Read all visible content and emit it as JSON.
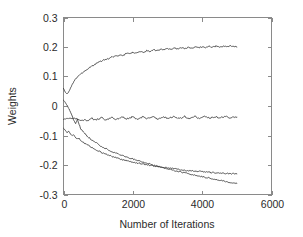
{
  "chart_data": {
    "type": "line",
    "title": "",
    "xlabel": "Number of Iterations",
    "ylabel": "Weights",
    "xlim": [
      0,
      6000
    ],
    "ylim": [
      -0.3,
      0.3
    ],
    "xticks": [
      0,
      2000,
      4000,
      6000
    ],
    "xticklabels": [
      "0",
      "2000",
      "4000",
      "6000"
    ],
    "yticks": [
      -0.3,
      -0.2,
      -0.1,
      0,
      0.1,
      0.2,
      0.3
    ],
    "yticklabels": [
      "-0.3",
      "-0.2",
      "-0.1",
      "0",
      "0.1",
      "0.2",
      "0.3"
    ],
    "grid": false,
    "legend": null,
    "line_color": "#3a3a3a",
    "axis_color": "#8a8a8a",
    "background": "#ffffff",
    "x_sample_points": [
      0,
      50,
      100,
      150,
      200,
      250,
      300,
      350,
      400,
      450,
      500,
      600,
      700,
      800,
      900,
      1000,
      1100,
      1200,
      1300,
      1400,
      1500,
      1600,
      1700,
      1800,
      1900,
      2000,
      2100,
      2200,
      2300,
      2400,
      2500,
      2600,
      2700,
      2800,
      2900,
      3000,
      3100,
      3200,
      3300,
      3400,
      3500,
      3600,
      3700,
      3800,
      3900,
      4000,
      4100,
      4200,
      4300,
      4400,
      4500,
      4600,
      4700,
      4800,
      4900,
      5000
    ],
    "series": [
      {
        "name": "weight-1",
        "start_value": 0.06,
        "final_value": 0.2,
        "values": [
          0.06,
          0.047,
          0.04,
          0.048,
          0.06,
          0.072,
          0.083,
          0.092,
          0.098,
          0.104,
          0.108,
          0.118,
          0.126,
          0.134,
          0.141,
          0.148,
          0.152,
          0.158,
          0.16,
          0.166,
          0.168,
          0.172,
          0.17,
          0.176,
          0.178,
          0.181,
          0.179,
          0.184,
          0.182,
          0.187,
          0.185,
          0.19,
          0.187,
          0.192,
          0.19,
          0.194,
          0.191,
          0.196,
          0.193,
          0.197,
          0.195,
          0.199,
          0.196,
          0.2,
          0.197,
          0.201,
          0.198,
          0.202,
          0.199,
          0.203,
          0.2,
          0.203,
          0.2,
          0.204,
          0.201,
          0.2
        ]
      },
      {
        "name": "weight-2",
        "start_value": -0.045,
        "final_value": -0.038,
        "values": [
          -0.045,
          -0.044,
          -0.043,
          -0.043,
          -0.042,
          -0.043,
          -0.042,
          -0.043,
          -0.045,
          -0.048,
          -0.05,
          -0.047,
          -0.05,
          -0.04,
          -0.048,
          -0.045,
          -0.038,
          -0.047,
          -0.044,
          -0.037,
          -0.046,
          -0.043,
          -0.036,
          -0.045,
          -0.042,
          -0.036,
          -0.045,
          -0.041,
          -0.036,
          -0.044,
          -0.041,
          -0.035,
          -0.044,
          -0.04,
          -0.036,
          -0.044,
          -0.04,
          -0.035,
          -0.043,
          -0.04,
          -0.035,
          -0.043,
          -0.039,
          -0.035,
          -0.042,
          -0.039,
          -0.035,
          -0.042,
          -0.038,
          -0.036,
          -0.041,
          -0.038,
          -0.036,
          -0.04,
          -0.038,
          -0.038
        ]
      },
      {
        "name": "weight-3",
        "start_value": 0.02,
        "final_value": -0.262,
        "values": [
          0.02,
          0.012,
          0.003,
          -0.008,
          -0.02,
          -0.035,
          -0.05,
          -0.06,
          -0.045,
          -0.062,
          -0.078,
          -0.092,
          -0.104,
          -0.114,
          -0.122,
          -0.13,
          -0.138,
          -0.144,
          -0.149,
          -0.155,
          -0.159,
          -0.164,
          -0.168,
          -0.172,
          -0.176,
          -0.18,
          -0.184,
          -0.187,
          -0.191,
          -0.194,
          -0.197,
          -0.201,
          -0.204,
          -0.207,
          -0.21,
          -0.213,
          -0.216,
          -0.219,
          -0.221,
          -0.224,
          -0.227,
          -0.229,
          -0.232,
          -0.234,
          -0.237,
          -0.239,
          -0.242,
          -0.244,
          -0.247,
          -0.249,
          -0.252,
          -0.254,
          -0.257,
          -0.259,
          -0.262,
          -0.262
        ]
      },
      {
        "name": "weight-4",
        "start_value": -0.075,
        "final_value": -0.23,
        "values": [
          -0.075,
          -0.083,
          -0.09,
          -0.086,
          -0.095,
          -0.101,
          -0.098,
          -0.107,
          -0.112,
          -0.11,
          -0.117,
          -0.126,
          -0.132,
          -0.14,
          -0.146,
          -0.152,
          -0.158,
          -0.162,
          -0.167,
          -0.171,
          -0.175,
          -0.179,
          -0.182,
          -0.185,
          -0.188,
          -0.19,
          -0.193,
          -0.195,
          -0.197,
          -0.199,
          -0.201,
          -0.203,
          -0.205,
          -0.207,
          -0.209,
          -0.21,
          -0.212,
          -0.213,
          -0.215,
          -0.216,
          -0.218,
          -0.219,
          -0.22,
          -0.221,
          -0.222,
          -0.223,
          -0.224,
          -0.225,
          -0.226,
          -0.227,
          -0.228,
          -0.228,
          -0.229,
          -0.229,
          -0.23,
          -0.23
        ]
      }
    ]
  }
}
